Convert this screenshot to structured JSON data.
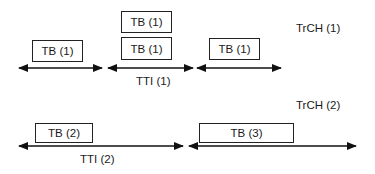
{
  "diagram": {
    "trch1": {
      "label": "TrCH (1)",
      "tti_label": "TTI (1)",
      "blocks": [
        "TB (1)",
        "TB (1)",
        "TB (1)",
        "TB (1)"
      ]
    },
    "trch2": {
      "label": "TrCH (2)",
      "tti_label": "TTI (2)",
      "blocks": [
        "TB (2)",
        "TB (3)"
      ]
    }
  }
}
